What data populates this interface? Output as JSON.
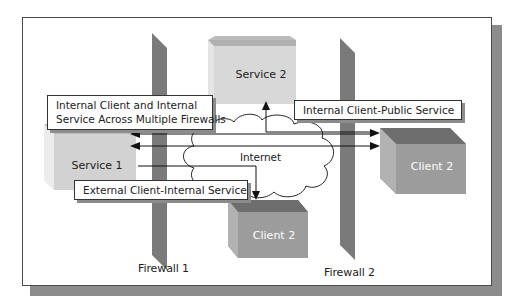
{
  "diagram": {
    "nodes": {
      "service1": {
        "label": "Service 1",
        "color": "#d6d6d6"
      },
      "service2": {
        "label": "Service 2",
        "color": "#d6d6d6"
      },
      "client2_center": {
        "label": "Client 2",
        "color": "#9a9a9a"
      },
      "client2_right": {
        "label": "Client 2",
        "color": "#9a9a9a"
      },
      "internet": {
        "label": "Internet"
      }
    },
    "firewalls": [
      {
        "label": "Firewall 1"
      },
      {
        "label": "Firewall 2"
      }
    ],
    "callouts": {
      "internal_multi": {
        "line1": "Internal Client and Internal",
        "line2": "Service Across Multiple Firewalls"
      },
      "internal_public": {
        "label": "Internal Client-Public Service"
      },
      "external_internal": {
        "label": "External Client-Internal Service"
      }
    },
    "colors": {
      "firewall": "#7a7a7a",
      "frame_shadow": "#8c8c8c",
      "arrow": "#111111"
    }
  }
}
